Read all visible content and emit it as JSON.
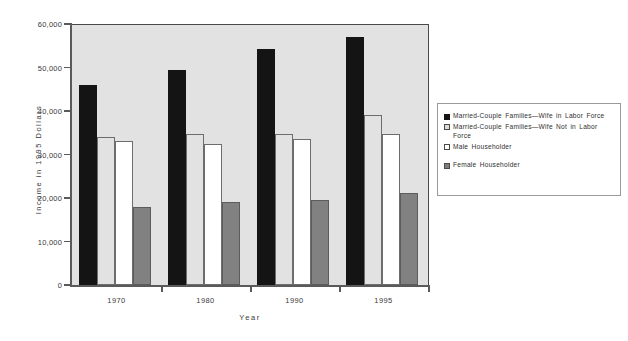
{
  "chart_data": {
    "type": "bar",
    "title": "",
    "xlabel": "Year",
    "ylabel": "Income in 1995 Dollars",
    "categories": [
      "1970",
      "1980",
      "1990",
      "1995"
    ],
    "ylim": [
      0,
      60000
    ],
    "yticks": [
      0,
      10000,
      20000,
      30000,
      40000,
      50000,
      60000
    ],
    "ytick_labels": [
      "0",
      "10,000",
      "20,000",
      "30,000",
      "40,000",
      "50,000",
      "60,000"
    ],
    "grid": false,
    "legend_position": "right",
    "series": [
      {
        "name": "Married-Couple Families—Wife in Labor Force",
        "color": "#141414",
        "values": [
          46000,
          49400,
          54200,
          57000
        ]
      },
      {
        "name": "Married-Couple Families—Wife Not in Labor Force",
        "color": "#e2e2e2",
        "values": [
          34000,
          34700,
          34700,
          39000
        ]
      },
      {
        "name": "Male Householder",
        "color": "#ffffff",
        "values": [
          33100,
          32400,
          33600,
          34700
        ]
      },
      {
        "name": "Female Householder",
        "color": "#818181",
        "values": [
          17900,
          19000,
          19500,
          21200
        ]
      }
    ]
  },
  "legend": {
    "entries": [
      "Married-Couple Families—Wife in Labor Force",
      "Married-Couple Families—Wife Not in Labor Force",
      "Male Householder",
      "Female Householder"
    ]
  },
  "axes": {
    "y_title": "Income  in  1995  Dollars",
    "x_title": "Year"
  }
}
